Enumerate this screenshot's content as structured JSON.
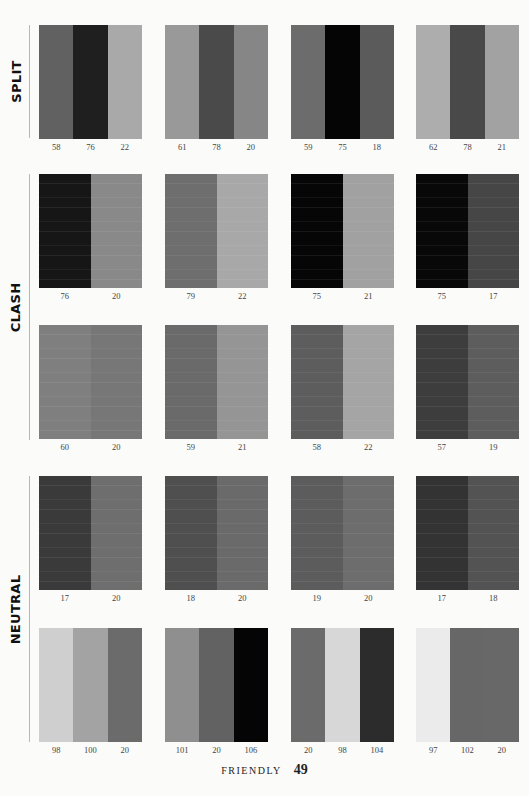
{
  "sections": [
    {
      "label": "SPLIT",
      "top": 25,
      "bottom": 138
    },
    {
      "label": "CLASH",
      "top": 174,
      "bottom": 440
    },
    {
      "label": "NEUTRAL",
      "top": 476,
      "bottom": 742
    }
  ],
  "column_x": [
    39,
    165,
    291,
    416
  ],
  "rows": [
    {
      "section": "SPLIT",
      "top": 25,
      "lined": false,
      "swatches": [
        {
          "colors": [
            "#616161",
            "#1f1f1f",
            "#a9a9a9"
          ],
          "labels": [
            "58",
            "76",
            "22"
          ]
        },
        {
          "colors": [
            "#999999",
            "#4a4a4a",
            "#868686"
          ],
          "labels": [
            "61",
            "78",
            "20"
          ]
        },
        {
          "colors": [
            "#6c6c6c",
            "#050505",
            "#5b5b5b"
          ],
          "labels": [
            "59",
            "75",
            "18"
          ]
        },
        {
          "colors": [
            "#adadad",
            "#494949",
            "#a2a2a2"
          ],
          "labels": [
            "62",
            "78",
            "21"
          ]
        }
      ]
    },
    {
      "section": "CLASH",
      "top": 174,
      "lined": true,
      "swatches": [
        {
          "colors": [
            "#161616",
            "#898989"
          ],
          "labels": [
            "76",
            "20"
          ]
        },
        {
          "colors": [
            "#6e6e6e",
            "#a8a8a8"
          ],
          "labels": [
            "79",
            "22"
          ]
        },
        {
          "colors": [
            "#060606",
            "#a1a1a1"
          ],
          "labels": [
            "75",
            "21"
          ]
        },
        {
          "colors": [
            "#080808",
            "#464646"
          ],
          "labels": [
            "75",
            "17"
          ]
        }
      ]
    },
    {
      "section": "CLASH",
      "top": 325,
      "lined": true,
      "swatches": [
        {
          "colors": [
            "#7f7f7f",
            "#777777"
          ],
          "labels": [
            "60",
            "20"
          ]
        },
        {
          "colors": [
            "#6a6a6a",
            "#959595"
          ],
          "labels": [
            "59",
            "21"
          ]
        },
        {
          "colors": [
            "#5d5d5d",
            "#a5a5a5"
          ],
          "labels": [
            "58",
            "22"
          ]
        },
        {
          "colors": [
            "#3d3d3d",
            "#5d5d5d"
          ],
          "labels": [
            "57",
            "19"
          ]
        }
      ]
    },
    {
      "section": "NEUTRAL",
      "top": 476,
      "lined": true,
      "swatches": [
        {
          "colors": [
            "#3a3a3a",
            "#6e6e6e"
          ],
          "labels": [
            "17",
            "20"
          ]
        },
        {
          "colors": [
            "#4f4f4f",
            "#6a6a6a"
          ],
          "labels": [
            "18",
            "20"
          ]
        },
        {
          "colors": [
            "#5c5c5c",
            "#6d6d6d"
          ],
          "labels": [
            "19",
            "20"
          ]
        },
        {
          "colors": [
            "#333333",
            "#535353"
          ],
          "labels": [
            "17",
            "18"
          ]
        }
      ]
    },
    {
      "section": "NEUTRAL",
      "top": 628,
      "lined": false,
      "swatches": [
        {
          "colors": [
            "#cfcfcf",
            "#a3a3a3",
            "#6b6b6b"
          ],
          "labels": [
            "98",
            "100",
            "20"
          ]
        },
        {
          "colors": [
            "#8f8f8f",
            "#626262",
            "#050505"
          ],
          "labels": [
            "101",
            "20",
            "106"
          ]
        },
        {
          "colors": [
            "#6b6b6b",
            "#d7d7d7",
            "#2c2c2c"
          ],
          "labels": [
            "20",
            "98",
            "104"
          ]
        },
        {
          "colors": [
            "#ebebeb",
            "#676767",
            "#686868"
          ],
          "labels": [
            "97",
            "102",
            "20"
          ]
        }
      ]
    }
  ],
  "footer": {
    "word": "FRIENDLY",
    "page": "49"
  }
}
